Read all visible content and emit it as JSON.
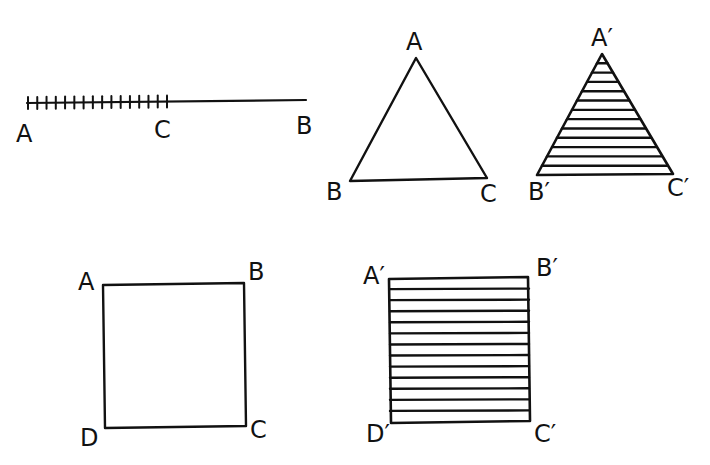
{
  "colors": {
    "ink": "#111111",
    "background": "#ffffff"
  },
  "figures": {
    "segment": {
      "labels": {
        "a": "A",
        "c": "C",
        "b": "B"
      },
      "tick_count": 16,
      "ticked_portion": "A to C"
    },
    "triangle": {
      "labels": {
        "a": "A",
        "b": "B",
        "c": "C"
      },
      "hatched": false
    },
    "triangle_prime": {
      "labels": {
        "a": "A′",
        "b": "B′",
        "c": "C′"
      },
      "hatched": true,
      "hatch_lines": 12
    },
    "square": {
      "labels": {
        "a": "A",
        "b": "B",
        "c": "C",
        "d": "D"
      },
      "hatched": false
    },
    "square_prime": {
      "labels": {
        "a": "A′",
        "b": "B′",
        "c": "C′",
        "d": "D′"
      },
      "hatched": true,
      "hatch_lines": 12
    }
  }
}
